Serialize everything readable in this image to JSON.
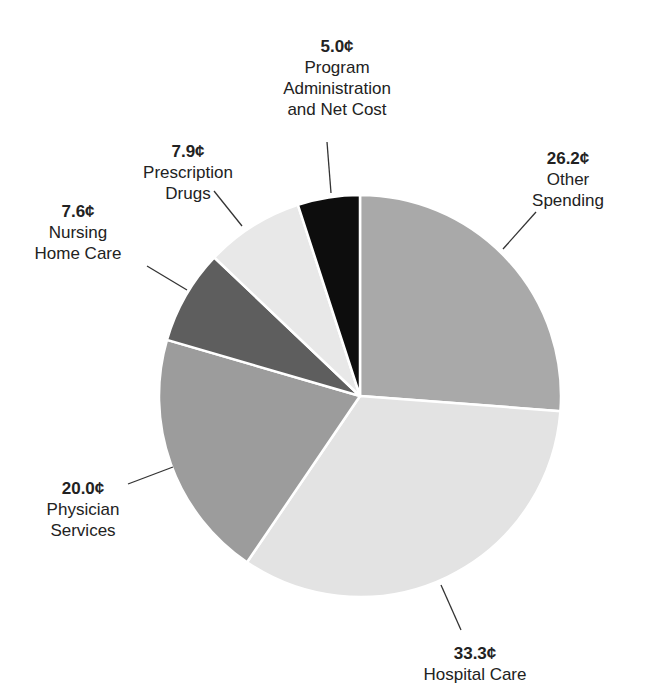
{
  "chart_data": {
    "type": "pie",
    "title": "",
    "unit": "¢",
    "start_angle_deg": 0,
    "direction": "clockwise",
    "slices": [
      {
        "label": "Other Spending",
        "value": 26.2,
        "display": "26.2¢",
        "color": "#a9a9a9"
      },
      {
        "label": "Hospital Care",
        "value": 33.3,
        "display": "33.3¢",
        "color": "#e3e3e3"
      },
      {
        "label": "Physician Services",
        "value": 20.0,
        "display": "20.0¢",
        "color": "#9c9c9c"
      },
      {
        "label": "Nursing Home Care",
        "value": 7.6,
        "display": "7.6¢",
        "color": "#5e5e5e"
      },
      {
        "label": "Prescription Drugs",
        "value": 7.9,
        "display": "7.9¢",
        "color": "#e8e8e8"
      },
      {
        "label": "Program Administration and Net Cost",
        "value": 5.0,
        "display": "5.0¢",
        "color": "#0d0d0d"
      }
    ],
    "legend": "none (callout labels with leader lines)"
  },
  "labels": {
    "other": {
      "value": "26.2¢",
      "line1": "Other",
      "line2": "Spending"
    },
    "hospital": {
      "value": "33.3¢",
      "line1": "Hospital Care"
    },
    "physician": {
      "value": "20.0¢",
      "line1": "Physician",
      "line2": "Services"
    },
    "nursing": {
      "value": "7.6¢",
      "line1": "Nursing",
      "line2": "Home Care"
    },
    "drugs": {
      "value": "7.9¢",
      "line1": "Prescription",
      "line2": "Drugs"
    },
    "admin": {
      "value": "5.0¢",
      "line1": "Program",
      "line2": "Administration",
      "line3": "and Net Cost"
    }
  }
}
